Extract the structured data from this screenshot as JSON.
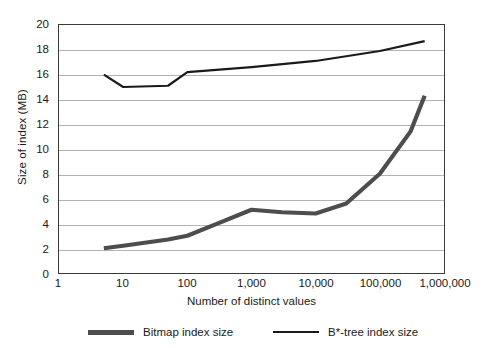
{
  "chart_data": {
    "type": "line",
    "title": "",
    "xlabel": "Number of distinct values",
    "ylabel": "Size of index (MB)",
    "xscale": "log",
    "xlim": [
      1,
      1000000
    ],
    "ylim": [
      0,
      20
    ],
    "ytick_step": 2,
    "grid": true,
    "grid_axis": "y",
    "legend_position": "bottom",
    "xticklabels": [
      "1",
      "10",
      "100",
      "1,000",
      "10,000",
      "100,000",
      "1,000,000"
    ],
    "xtickvalues": [
      1,
      10,
      100,
      1000,
      10000,
      100000,
      1000000
    ],
    "yticklabels": [
      "0",
      "2",
      "4",
      "6",
      "8",
      "10",
      "12",
      "14",
      "16",
      "18",
      "20"
    ],
    "ytickvalues": [
      0,
      2,
      4,
      6,
      8,
      10,
      12,
      14,
      16,
      18,
      20
    ],
    "series": [
      {
        "name": "Bitmap index size",
        "color": "#4d4d4d",
        "linewidth": 4.2,
        "x": [
          5,
          10,
          50,
          100,
          300,
          1000,
          3000,
          10000,
          30000,
          100000,
          300000,
          500000
        ],
        "values": [
          2.0,
          2.2,
          2.7,
          3.0,
          4.0,
          5.1,
          4.9,
          4.8,
          5.6,
          8.0,
          11.4,
          14.3
        ]
      },
      {
        "name": "B*-tree index size",
        "color": "#1a1a1a",
        "linewidth": 2.2,
        "x": [
          5,
          10,
          50,
          100,
          1000,
          10000,
          100000,
          500000
        ],
        "values": [
          16.0,
          15.0,
          15.1,
          16.2,
          16.6,
          17.1,
          17.9,
          18.7
        ]
      }
    ]
  },
  "legend": {
    "items": [
      {
        "label": "Bitmap index size",
        "swatch": "thick-gray-line"
      },
      {
        "label": "B*-tree index size",
        "swatch": "thin-black-line"
      }
    ]
  }
}
